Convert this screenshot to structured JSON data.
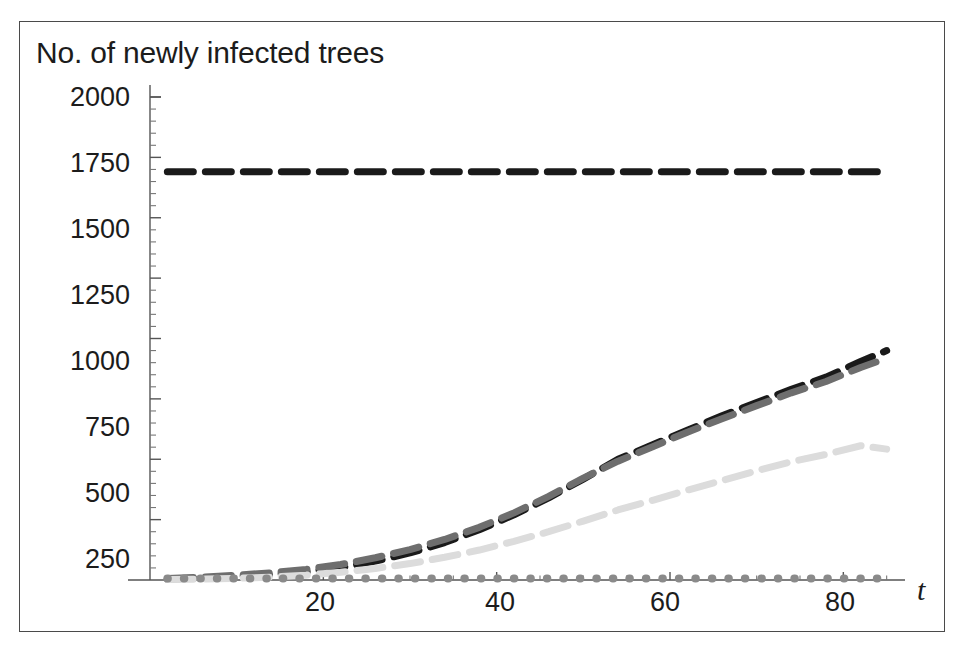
{
  "figure": {
    "title": "No. of newly infected trees",
    "background": "#ffffff",
    "frame_color": "#4a4a4a"
  },
  "axis": {
    "x_label": "t",
    "y_label": "No. of newly infected trees",
    "x_ticks": [
      "20",
      "40",
      "60",
      "80"
    ],
    "y_ticks": [
      "2000",
      "1750",
      "1500",
      "1250",
      "1000",
      "750",
      "500",
      "250"
    ]
  },
  "chart_data": {
    "type": "line",
    "title": "No. of newly infected trees",
    "xlabel": "t",
    "ylabel": "No. of newly infected trees",
    "xlim": [
      0,
      90
    ],
    "ylim": [
      0,
      2050
    ],
    "xticks": [
      20,
      40,
      60,
      80
    ],
    "yticks": [
      250,
      500,
      750,
      1000,
      1250,
      1500,
      1750,
      2000
    ],
    "grid": false,
    "legend": "none",
    "x": [
      2,
      6,
      10,
      14,
      18,
      22,
      26,
      30,
      34,
      38,
      42,
      46,
      50,
      54,
      58,
      62,
      66,
      70,
      74,
      78,
      82,
      85
    ],
    "series": [
      {
        "name": "constant-high",
        "style": "dashed",
        "color": "#1a1a1a",
        "width": 7,
        "values": [
          1690,
          1690,
          1690,
          1690,
          1690,
          1690,
          1690,
          1690,
          1690,
          1690,
          1690,
          1690,
          1690,
          1690,
          1690,
          1690,
          1690,
          1690,
          1690,
          1690,
          1690,
          1690
        ]
      },
      {
        "name": "rising-dark",
        "style": "dashed",
        "color": "#1a1a1a",
        "width": 7,
        "values": [
          4,
          8,
          14,
          22,
          34,
          52,
          78,
          112,
          155,
          208,
          270,
          340,
          418,
          500,
          560,
          620,
          680,
          735,
          790,
          840,
          905,
          950
        ]
      },
      {
        "name": "rising-gray",
        "style": "dashed",
        "color": "#6e6e6e",
        "width": 7,
        "values": [
          6,
          12,
          20,
          30,
          44,
          64,
          92,
          126,
          168,
          218,
          278,
          346,
          422,
          492,
          552,
          612,
          668,
          722,
          775,
          822,
          880,
          918
        ]
      },
      {
        "name": "rising-light",
        "style": "dashed",
        "color": "#dcdcdc",
        "width": 7,
        "values": [
          2,
          4,
          7,
          12,
          20,
          32,
          48,
          68,
          94,
          124,
          160,
          200,
          244,
          290,
          330,
          372,
          412,
          452,
          490,
          520,
          556,
          542
        ]
      },
      {
        "name": "near-zero",
        "style": "dotted",
        "color": "#8a8a8a",
        "width": 8,
        "values": [
          6,
          6,
          6,
          6,
          6,
          6,
          6,
          6,
          6,
          6,
          6,
          6,
          6,
          6,
          6,
          6,
          6,
          6,
          6,
          6,
          6,
          6
        ]
      }
    ]
  }
}
